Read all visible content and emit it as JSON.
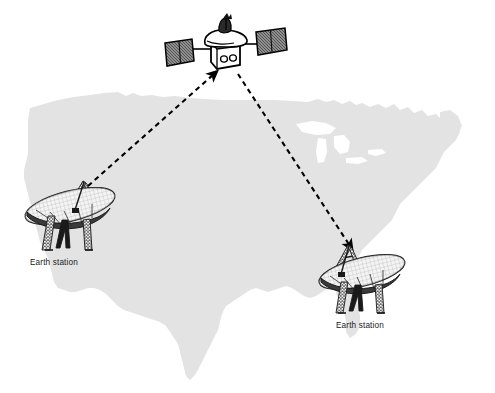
{
  "diagram": {
    "background_color": "#ffffff",
    "map": {
      "name": "United States",
      "fill_color": "#e3e3e3",
      "great_lakes_color": "#ffffff"
    },
    "satellite": {
      "name": "communications satellite",
      "body_color": "#ffffff",
      "outline_color": "#000000",
      "panel_fill": "#9a9a9a",
      "parts": [
        "left-solar-panel",
        "right-solar-panel",
        "satellite-body",
        "satellite-dish-antenna"
      ]
    },
    "links": [
      {
        "name": "uplink-left",
        "from": "left-earth-station",
        "to": "satellite",
        "style": "dashed",
        "color": "#000000",
        "arrow": "to-satellite"
      },
      {
        "name": "downlink-right",
        "from": "satellite",
        "to": "right-earth-station",
        "style": "dashed",
        "color": "#000000",
        "arrow": "to-earth-station"
      }
    ],
    "stations": [
      {
        "id": "left-earth-station",
        "label": "Earth station",
        "dish_fill": "#f2f2f2",
        "structure_color": "#1a1a1a"
      },
      {
        "id": "right-earth-station",
        "label": "Earth station",
        "dish_fill": "#f2f2f2",
        "structure_color": "#1a1a1a"
      }
    ]
  }
}
